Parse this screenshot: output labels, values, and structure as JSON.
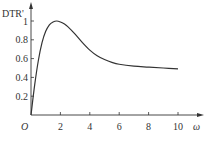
{
  "chart_data": {
    "type": "line",
    "title": "",
    "xlabel": "ω",
    "ylabel": "DTR'",
    "origin_label": "O",
    "xlim": [
      0,
      10.8
    ],
    "ylim": [
      0,
      1.1
    ],
    "x_ticks": [
      2,
      4,
      6,
      8,
      10
    ],
    "x_tick_labels": [
      "2",
      "4",
      "6",
      "8",
      "10"
    ],
    "y_ticks": [
      0.2,
      0.4,
      0.6,
      0.8,
      1
    ],
    "y_tick_labels": [
      "0.2",
      "0.4",
      "0.6",
      "0.8",
      "1"
    ],
    "grid": false,
    "legend": null,
    "series": [
      {
        "name": "DTR'",
        "x": [
          0,
          0.25,
          0.5,
          0.75,
          1.0,
          1.25,
          1.5,
          1.75,
          2.0,
          2.25,
          2.5,
          3.0,
          3.5,
          4.0,
          4.5,
          5.0,
          5.5,
          6.0,
          7.0,
          8.0,
          9.0,
          10.0
        ],
        "values": [
          0,
          0.32,
          0.58,
          0.77,
          0.89,
          0.96,
          0.99,
          1.0,
          0.99,
          0.97,
          0.94,
          0.86,
          0.77,
          0.69,
          0.63,
          0.59,
          0.56,
          0.54,
          0.52,
          0.51,
          0.5,
          0.49
        ]
      }
    ]
  }
}
